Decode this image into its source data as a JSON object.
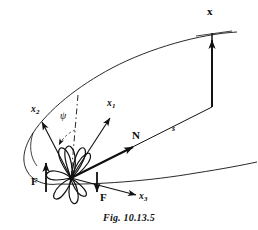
{
  "figure": {
    "caption": "Fig. 10.13.5",
    "stroke_color": "#111111",
    "background": "#ffffff",
    "labels": {
      "x_vector": "x",
      "normal_vector": "N",
      "arclength": "s",
      "axis_1": "x",
      "axis_1_sub": "1",
      "axis_2": "x",
      "axis_2_sub": "2",
      "axis_3": "x",
      "axis_3_sub": "3",
      "angle_psi": "ψ",
      "force_left": "F",
      "force_right": "F"
    },
    "geometry": {
      "origin": [
        70,
        178
      ],
      "x_vector_tip": [
        212,
        33
      ],
      "x_vector_base": [
        212,
        107
      ],
      "normal_tip": [
        130,
        143
      ],
      "axis1_tip": [
        108,
        110
      ],
      "axis2_tip": [
        40,
        113
      ],
      "axis3_tip": [
        140,
        196
      ],
      "force_left_arrow": [
        46,
        163
      ],
      "force_right_arrow": [
        97,
        190
      ]
    }
  }
}
